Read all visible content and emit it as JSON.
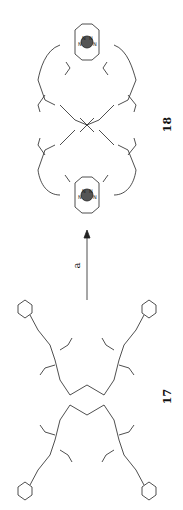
{
  "scheme": {
    "orientation": "rotated 90 degrees counter-clockwise",
    "product": {
      "label": "18",
      "description": "macrocyclic dimer with two metal-bis(terpyridine) complexes linked via tert-butyl ester dendron arms"
    },
    "reagent_arrow": {
      "label": "a",
      "direction": "up"
    },
    "starting_material": {
      "label": "17",
      "description": "tetra-arm dendrimer with four terpyridine termini and tert-butyl ester branches"
    },
    "atom_labels": [
      "N",
      "O",
      "H"
    ]
  }
}
